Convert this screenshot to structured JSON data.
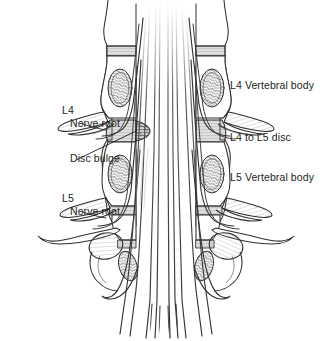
{
  "figure": {
    "background_color": "#ffffff",
    "ink_color": "#231f20",
    "line_color": "#3a3a3a",
    "shading_color": "#8c8c8c"
  },
  "labels": {
    "left": [
      {
        "id": "l4-nerve-root",
        "line1": "L4",
        "line2": "Nerve root",
        "has_leader_line": true
      },
      {
        "id": "disc-bulge",
        "line1": "Disc bulge",
        "line2": "",
        "has_leader_line": true
      },
      {
        "id": "l5-nerve-root",
        "line1": "L5",
        "line2": "Nerve root",
        "has_leader_line": true
      }
    ],
    "right": [
      {
        "id": "l4-vertebral-body",
        "text": "L4  Vertebral body",
        "has_leader_line": false
      },
      {
        "id": "l4l5-disc",
        "text": "L4 to L5 disc",
        "has_leader_line": false
      },
      {
        "id": "l5-vertebral-body",
        "text": "L5  Vertebral body",
        "has_leader_line": false
      }
    ]
  },
  "structures": {
    "cauda_equina": "vertical nerve fibres in spinal canal",
    "vertebral_bodies": [
      "L4",
      "L5",
      "S1"
    ],
    "discs": [
      "L4 to L5 disc"
    ],
    "nerve_roots": [
      "L4 nerve root",
      "L5 nerve root"
    ],
    "pathology": "Disc bulge at L4 to L5 level compressing the canal"
  }
}
